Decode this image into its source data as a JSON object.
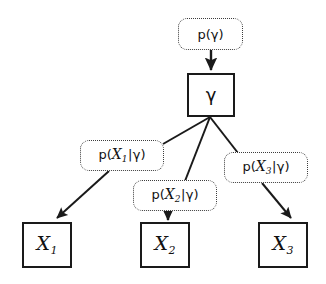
{
  "diagram": {
    "type": "directed-graphical-model",
    "colors": {
      "node_border": "#1a1a1a",
      "factor_border": "#3d3d3d",
      "edge": "#1a1a1a",
      "text": "#111111",
      "background": "#ffffff"
    },
    "nodes": [
      {
        "id": "prior",
        "kind": "factor",
        "style": "dotted-rounded",
        "label_parts": {
          "p": "p(",
          "variable": "",
          "subscript": "",
          "bar": "",
          "gamma": "γ",
          "close": ")"
        },
        "label_text": "p(γ)",
        "x": 178,
        "y": 18,
        "w": 65,
        "h": 32
      },
      {
        "id": "gamma",
        "kind": "variable",
        "style": "solid-square",
        "label_text": "γ",
        "x": 187,
        "y": 73,
        "w": 48,
        "h": 44
      },
      {
        "id": "cond1",
        "kind": "factor",
        "style": "dotted-rounded",
        "label_parts": {
          "p": "p(",
          "variable": "X",
          "subscript": "1",
          "bar": "|",
          "gamma": "γ",
          "close": ")"
        },
        "label_text": "p(X1|γ)",
        "x": 80,
        "y": 140,
        "w": 84,
        "h": 31
      },
      {
        "id": "cond2",
        "kind": "factor",
        "style": "dotted-rounded",
        "label_parts": {
          "p": "p(",
          "variable": "X",
          "subscript": "2",
          "bar": "|",
          "gamma": "γ",
          "close": ")"
        },
        "label_text": "p(X2|γ)",
        "x": 133,
        "y": 180,
        "w": 84,
        "h": 31
      },
      {
        "id": "cond3",
        "kind": "factor",
        "style": "dotted-rounded",
        "label_parts": {
          "p": "p(",
          "variable": "X",
          "subscript": "3",
          "bar": "|",
          "gamma": "γ",
          "close": ")"
        },
        "label_text": "p(X3|γ)",
        "x": 224,
        "y": 152,
        "w": 84,
        "h": 31
      },
      {
        "id": "x1",
        "kind": "variable",
        "style": "solid-square",
        "label_parts": {
          "variable": "X",
          "subscript": "1"
        },
        "label_text": "X1",
        "x": 22,
        "y": 222,
        "w": 50,
        "h": 46
      },
      {
        "id": "x2",
        "kind": "variable",
        "style": "solid-square",
        "label_parts": {
          "variable": "X",
          "subscript": "2"
        },
        "label_text": "X2",
        "x": 140,
        "y": 222,
        "w": 50,
        "h": 46
      },
      {
        "id": "x3",
        "kind": "variable",
        "style": "solid-square",
        "label_parts": {
          "variable": "X",
          "subscript": "3"
        },
        "label_text": "X3",
        "x": 258,
        "y": 222,
        "w": 50,
        "h": 46
      }
    ],
    "edges": [
      {
        "id": "e-prior-gamma",
        "from": "prior",
        "to": "gamma",
        "arrowhead": true,
        "x1": 211,
        "y1": 50,
        "x2": 211,
        "y2": 71
      },
      {
        "id": "e-gamma-cond1",
        "from": "gamma",
        "to": "cond1",
        "arrowhead": false,
        "x1": 210,
        "y1": 117,
        "x2": 163,
        "y2": 144
      },
      {
        "id": "e-gamma-cond2",
        "from": "gamma",
        "to": "cond2",
        "arrowhead": false,
        "x1": 210,
        "y1": 117,
        "x2": 185,
        "y2": 180
      },
      {
        "id": "e-gamma-cond3",
        "from": "gamma",
        "to": "cond3",
        "arrowhead": false,
        "x1": 210,
        "y1": 117,
        "x2": 237,
        "y2": 152
      },
      {
        "id": "e-cond1-x1",
        "from": "cond1",
        "to": "x1",
        "arrowhead": true,
        "x1": 109,
        "y1": 171,
        "x2": 56,
        "y2": 219
      },
      {
        "id": "e-cond2-x2",
        "from": "cond2",
        "to": "x2",
        "arrowhead": true,
        "x1": 168,
        "y1": 211,
        "x2": 168,
        "y2": 220
      },
      {
        "id": "e-cond3-x3",
        "from": "cond3",
        "to": "x3",
        "arrowhead": true,
        "x1": 262,
        "y1": 183,
        "x2": 290,
        "y2": 219
      }
    ]
  }
}
